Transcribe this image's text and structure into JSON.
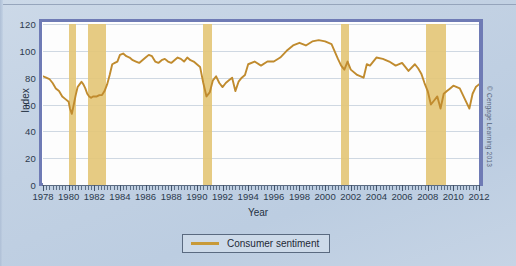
{
  "credit": "© Cengage Learning 2013",
  "legend": {
    "label": "Consumer sentiment"
  },
  "chart_data": {
    "type": "line",
    "title": "",
    "xlabel": "Year",
    "ylabel": "Index",
    "xlim": [
      1978,
      2012
    ],
    "ylim": [
      0,
      120
    ],
    "grid": true,
    "legend_position": "bottom-center",
    "ytick_labels": [
      "0",
      "20",
      "40",
      "60",
      "80",
      "100",
      "120"
    ],
    "yticks": [
      0,
      20,
      40,
      60,
      80,
      100,
      120
    ],
    "xtick_labels": [
      "1978",
      "1980",
      "1982",
      "1984",
      "1986",
      "1988",
      "1990",
      "1992",
      "1994",
      "1996",
      "1998",
      "2000",
      "2002",
      "2004",
      "2006",
      "2008",
      "2010",
      "2012"
    ],
    "xticks": [
      1978,
      1980,
      1982,
      1984,
      1986,
      1988,
      1990,
      1992,
      1994,
      1996,
      1998,
      2000,
      2002,
      2004,
      2006,
      2008,
      2010,
      2012
    ],
    "minor_tick_interval": 0.25,
    "series": [
      {
        "name": "Consumer sentiment",
        "color": "#c08b2e",
        "x": [
          1978.0,
          1978.25,
          1978.5,
          1978.75,
          1979.0,
          1979.25,
          1979.5,
          1979.75,
          1980.0,
          1980.1,
          1980.25,
          1980.4,
          1980.55,
          1980.7,
          1980.85,
          1981.0,
          1981.15,
          1981.3,
          1981.45,
          1981.6,
          1981.75,
          1981.9,
          1982.05,
          1982.2,
          1982.4,
          1982.6,
          1982.8,
          1983.0,
          1983.2,
          1983.4,
          1983.6,
          1983.8,
          1984.0,
          1984.25,
          1984.5,
          1984.75,
          1985.0,
          1985.25,
          1985.5,
          1985.75,
          1986.0,
          1986.25,
          1986.5,
          1986.75,
          1987.0,
          1987.25,
          1987.5,
          1987.75,
          1988.0,
          1988.25,
          1988.5,
          1988.75,
          1989.0,
          1989.25,
          1989.5,
          1989.75,
          1990.0,
          1990.25,
          1990.5,
          1990.75,
          1991.0,
          1991.25,
          1991.5,
          1991.75,
          1992.0,
          1992.25,
          1992.5,
          1992.75,
          1993.0,
          1993.25,
          1993.5,
          1993.75,
          1994.0,
          1994.5,
          1995.0,
          1995.5,
          1996.0,
          1996.5,
          1997.0,
          1997.5,
          1998.0,
          1998.5,
          1999.0,
          1999.5,
          2000.0,
          2000.5,
          2001.0,
          2001.25,
          2001.5,
          2001.75,
          2002.0,
          2002.5,
          2003.0,
          2003.25,
          2003.5,
          2004.0,
          2004.5,
          2005.0,
          2005.5,
          2006.0,
          2006.5,
          2007.0,
          2007.25,
          2007.5,
          2007.75,
          2008.0,
          2008.25,
          2008.5,
          2008.75,
          2009.0,
          2009.25,
          2009.5,
          2009.75,
          2010.0,
          2010.5,
          2011.0,
          2011.25,
          2011.5,
          2011.75,
          2012.0
        ],
        "y": [
          81,
          80,
          79,
          76,
          72,
          70,
          66,
          64,
          62,
          57,
          53,
          60,
          67,
          73,
          75,
          77,
          75,
          72,
          68,
          66,
          65,
          66,
          66,
          66,
          67,
          67,
          70,
          75,
          82,
          90,
          91,
          92,
          97,
          98,
          96,
          95,
          93,
          92,
          91,
          93,
          95,
          97,
          96,
          92,
          91,
          93,
          94,
          92,
          91,
          93,
          95,
          94,
          92,
          95,
          93,
          92,
          90,
          88,
          76,
          66,
          69,
          78,
          81,
          76,
          73,
          76,
          78,
          80,
          70,
          77,
          80,
          82,
          90,
          92,
          89,
          92,
          92,
          95,
          100,
          104,
          106,
          104,
          107,
          108,
          107,
          105,
          94,
          89,
          86,
          92,
          86,
          82,
          80,
          90,
          89,
          95,
          94,
          92,
          89,
          91,
          85,
          90,
          87,
          83,
          76,
          70,
          60,
          63,
          66,
          57,
          68,
          70,
          72,
          74,
          72,
          62,
          57,
          68,
          73,
          75
        ]
      }
    ],
    "recession_bands": [
      {
        "start": 1980.0,
        "end": 1980.55,
        "label": "1980 recession"
      },
      {
        "start": 1981.5,
        "end": 1982.9,
        "label": "1981-82 recession"
      },
      {
        "start": 1990.5,
        "end": 1991.2,
        "label": "1990-91 recession"
      },
      {
        "start": 2001.2,
        "end": 2001.9,
        "label": "2001 recession"
      },
      {
        "start": 2007.9,
        "end": 2009.4,
        "label": "2007-09 recession"
      }
    ],
    "band_color": "#e4c778",
    "accent_color": "#6f7bb5"
  }
}
